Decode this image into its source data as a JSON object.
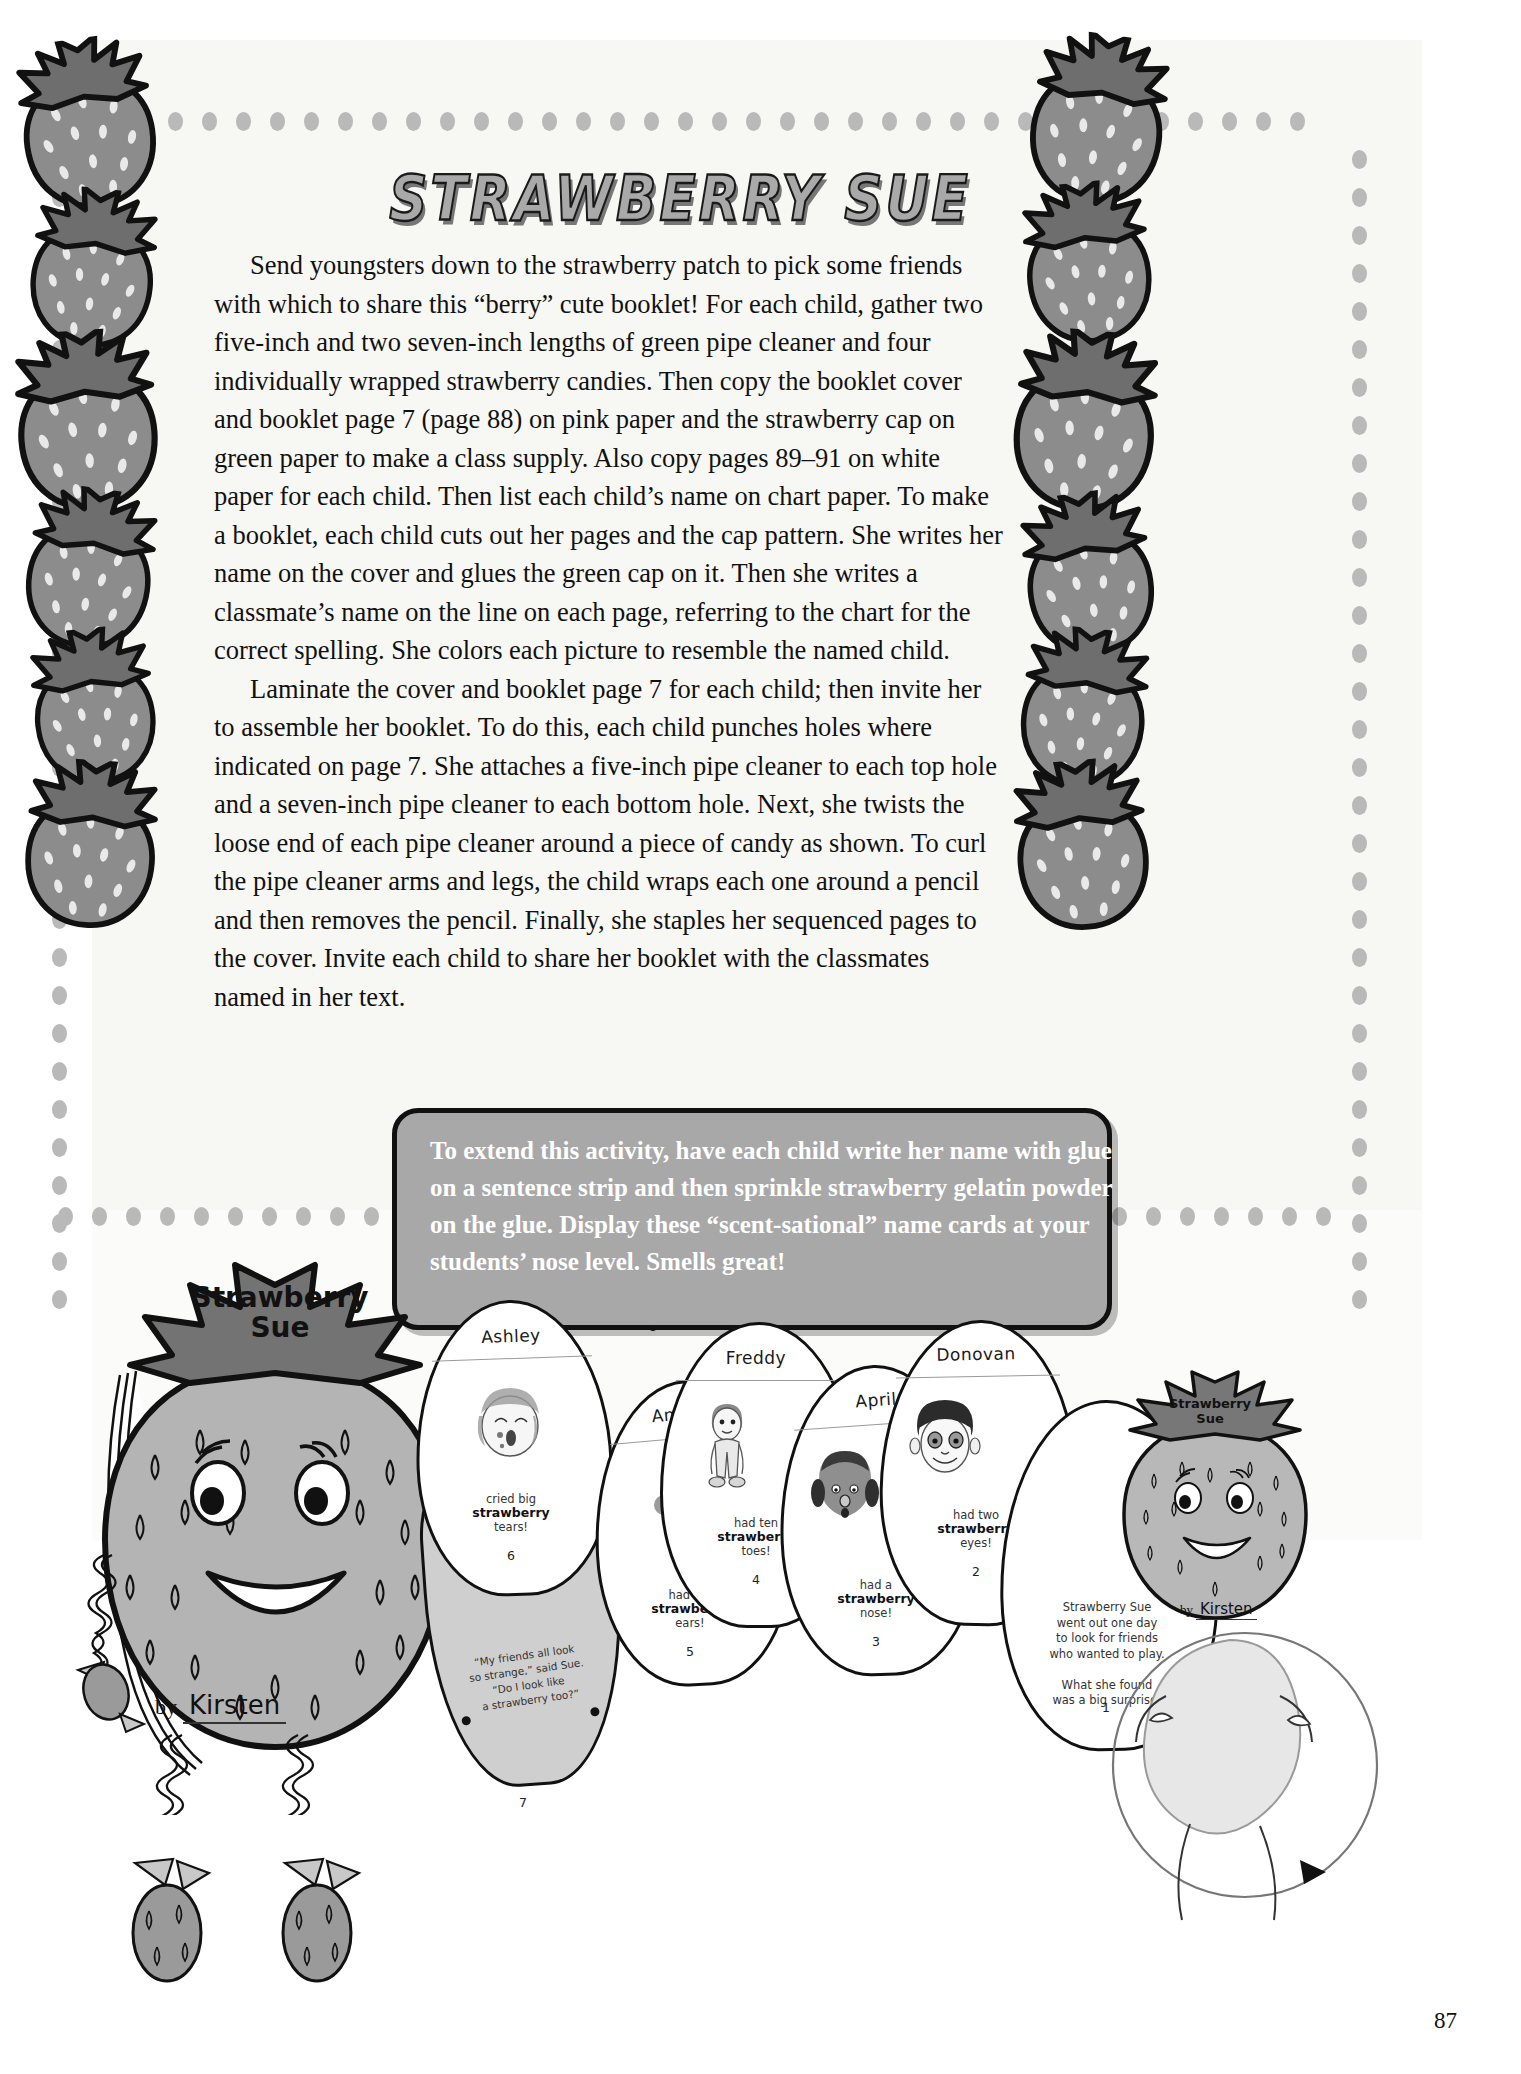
{
  "page": {
    "number": "87",
    "title": "STRAWBERRY SUE"
  },
  "article": {
    "paragraphs": [
      "Send youngsters down to the strawberry patch to pick some friends with which to share this “berry” cute booklet! For each child, gather two five-inch and two seven-inch lengths of green pipe cleaner and four individually wrapped strawberry candies. Then copy the booklet cover and booklet page 7 (page 88) on pink paper and the strawberry cap on green paper to make a class supply. Also copy pages 89–91 on white paper for each child. Then list each child’s name on chart paper. To make a booklet, each child cuts out her pages and the cap pattern. She writes her name on the cover and glues the green cap on it. Then she writes a classmate’s name on the line on each page, referring to the chart for the correct spelling. She colors each picture to resemble the named child.",
      "Laminate the cover and booklet page 7 for each child; then invite her to assemble her booklet. To do this, each child punches holes where indicated on page 7. She attaches a five-inch pipe cleaner to each top hole and a seven-inch pipe cleaner to each bottom hole. Next, she twists the loose end of each pipe cleaner around a piece of candy as shown. To curl the pipe cleaner arms and legs, the child wraps each one around a pencil and then removes the pencil. Finally, she staples her sequenced pages to the cover. Invite each child to share her booklet with the classmates named in her text."
    ]
  },
  "callout": {
    "text": "To extend this activity, have each child write her name with glue on a sentence strip and then sprinkle strawberry gelatin powder on the glue. Display these “scent-sational” name cards at your students’ nose level. Smells great!",
    "background_color": "#a8a8a8",
    "text_color": "#ffffff"
  },
  "cover": {
    "title_line1": "Strawberry",
    "title_line2": "Sue",
    "by_label": "by",
    "child_name": "Kirsten"
  },
  "cover_small": {
    "title_line1": "Strawberry",
    "title_line2": "Sue",
    "by_label": "by",
    "child_name": "Kirsten"
  },
  "booklet_pages": [
    {
      "id": "page-1",
      "name": "",
      "caption_lines": [
        "Strawberry Sue",
        "went out one day",
        "to look for friends",
        "who wanted to play.",
        "",
        "What she found",
        "was a big surprise!"
      ],
      "number": "1"
    },
    {
      "id": "page-2",
      "name": "Donovan",
      "caption_pre": "had two",
      "caption_bold": "strawberry",
      "caption_post": "eyes!",
      "number": "2"
    },
    {
      "id": "page-3",
      "name": "April",
      "caption_pre": "had a",
      "caption_bold": "strawberry",
      "caption_post": "nose!",
      "number": "3"
    },
    {
      "id": "page-4",
      "name": "Freddy",
      "caption_pre": "had ten",
      "caption_bold": "strawberry",
      "caption_post": "toes!",
      "number": "4"
    },
    {
      "id": "page-5",
      "name": "Angelica",
      "caption_pre": "had big",
      "caption_bold": "strawberry",
      "caption_post": "ears!",
      "number": "5"
    },
    {
      "id": "page-6",
      "name": "Ashley",
      "caption_pre": "cried big",
      "caption_bold": "strawberry",
      "caption_post": "tears!",
      "number": "6"
    },
    {
      "id": "page-7",
      "name": "",
      "caption_lines": [
        "“My friends all look",
        "so strange,” said Sue.",
        "“Do I look like",
        "a strawberry too?”"
      ],
      "number": "7"
    }
  ],
  "colors": {
    "berry_fill": "#8c8c8c",
    "berry_outline": "#111111",
    "cap_fill": "#6e6e6e",
    "paper": "#ffffff",
    "panel": "#f7f7f4"
  }
}
